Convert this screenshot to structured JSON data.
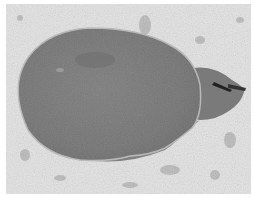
{
  "image": {
    "description": "Grayscale photograph of an electric ray resting on a sandy seabed",
    "subject": "electric ray",
    "background": "sand with scattered debris",
    "colors": {
      "border": "#ffffff",
      "sand": "#e2e2e2",
      "sand_shadow": "#9a9a9a",
      "body": "#7a7a7a",
      "body_dark": "#6a6a6a",
      "rim": "#b8b8b8",
      "fin_stripe": "#222222"
    }
  }
}
